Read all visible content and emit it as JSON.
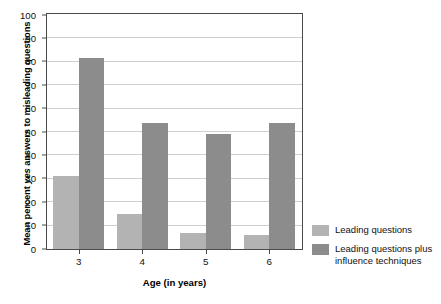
{
  "chart_data": {
    "type": "bar",
    "title": "",
    "xlabel": "Age (in years)",
    "ylabel": "Mean percent yes answers to misleading questions",
    "ylabel_italic_word": "yes",
    "categories": [
      "3",
      "4",
      "5",
      "6"
    ],
    "ylim": [
      0,
      100
    ],
    "yticks": [
      0,
      10,
      20,
      30,
      40,
      50,
      60,
      70,
      80,
      90,
      100
    ],
    "grid": "horizontal",
    "legend_position": "right",
    "series": [
      {
        "name": "Leading questions",
        "color": "#b3b3b3",
        "values": [
          31,
          15,
          7,
          6
        ]
      },
      {
        "name": "Leading questions plus influence techniques",
        "color": "#8c8c8c",
        "values": [
          81.5,
          54,
          49,
          54
        ]
      }
    ]
  },
  "axes": {
    "y_title_prefix": "Mean percent ",
    "y_title_italic": "yes",
    "y_title_suffix": " answers to misleading questions",
    "x_title": "Age (in years)"
  },
  "legend": {
    "items": [
      {
        "label": "Leading questions",
        "color": "#b3b3b3"
      },
      {
        "label": "Leading questions plus influence techniques",
        "color": "#8c8c8c"
      }
    ]
  },
  "colors": {
    "series1": "#b3b3b3",
    "series2": "#8c8c8c",
    "gridline": "#cfcfcf",
    "axis": "#4a4a4a",
    "background": "#ffffff",
    "text": "#111111"
  }
}
